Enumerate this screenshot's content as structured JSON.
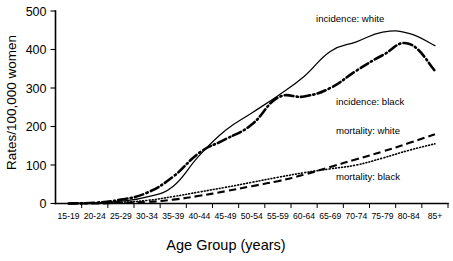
{
  "chart_data": {
    "type": "line",
    "title": "",
    "xlabel": "Age Group (years)",
    "ylabel": "Rates/100,000 women",
    "categories": [
      "15-19",
      "20-24",
      "25-29",
      "30-34",
      "35-39",
      "40-44",
      "45-49",
      "50-54",
      "55-59",
      "60-64",
      "65-69",
      "70-74",
      "75-79",
      "80-84",
      "85+"
    ],
    "ylim": [
      0,
      500
    ],
    "yticks": [
      0,
      100,
      200,
      300,
      400,
      500
    ],
    "ytick_labels": [
      "0",
      "100",
      "200",
      "300",
      "400",
      "500"
    ],
    "grid": false,
    "legend_position": "inline-annotations",
    "series": [
      {
        "name": "incidence: white",
        "label": "incidence:  white",
        "style": "solid-thin",
        "color": "#000000",
        "values": [
          0,
          1,
          6,
          17,
          45,
          125,
          190,
          235,
          280,
          330,
          395,
          420,
          445,
          442,
          410
        ]
      },
      {
        "name": "incidence: black",
        "label": "incidence:  black",
        "style": "dash-dot-thick",
        "color": "#000000",
        "values": [
          0,
          2,
          10,
          28,
          70,
          132,
          167,
          205,
          275,
          278,
          300,
          345,
          385,
          415,
          345
        ]
      },
      {
        "name": "mortality: white",
        "label": "mortality:  white",
        "style": "dashed",
        "color": "#000000",
        "values": [
          0,
          0,
          2,
          4,
          10,
          20,
          32,
          45,
          58,
          75,
          95,
          115,
          135,
          157,
          180
        ]
      },
      {
        "name": "mortality: black",
        "label": "mortality:  black",
        "style": "dotted",
        "color": "#000000",
        "values": [
          0,
          1,
          3,
          8,
          18,
          30,
          42,
          55,
          68,
          80,
          90,
          100,
          118,
          138,
          155
        ]
      }
    ],
    "annotations": [
      {
        "text": "incidence:  white",
        "x_px": 316,
        "y_px": 22
      },
      {
        "text": "incidence:  black",
        "x_px": 336,
        "y_px": 105
      },
      {
        "text": "mortality:  white",
        "x_px": 336,
        "y_px": 134
      },
      {
        "text": "mortality:  black",
        "x_px": 336,
        "y_px": 180
      }
    ]
  }
}
